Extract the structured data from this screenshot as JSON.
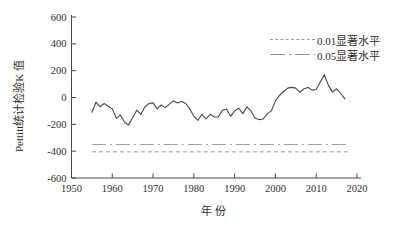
{
  "colors": {
    "background": "#ffffff",
    "axis": "#4a4a4a",
    "curve": "#474747",
    "ref_line": "#9b9b9b",
    "text": "#2f2f2f"
  },
  "legend": {
    "items": [
      {
        "label": "0.01显著水平",
        "style": "dashed"
      },
      {
        "label": "0.05显著水平",
        "style": "dashdot"
      }
    ]
  },
  "chart_data": {
    "type": "line",
    "title": "",
    "xlabel": "年份",
    "ylabel": "Pettitt统计检验K 值",
    "xlim": [
      1950,
      2020
    ],
    "ylim": [
      -600,
      600
    ],
    "grid": false,
    "legend_position": "top-right",
    "x_ticks": [
      1950,
      1960,
      1970,
      1980,
      1990,
      2000,
      2010,
      2020
    ],
    "y_ticks": [
      600,
      400,
      200,
      0,
      -200,
      -400,
      -600
    ],
    "x": [
      1955,
      1956,
      1957,
      1958,
      1959,
      1960,
      1961,
      1962,
      1963,
      1964,
      1965,
      1966,
      1967,
      1968,
      1969,
      1970,
      1971,
      1972,
      1973,
      1974,
      1975,
      1976,
      1977,
      1978,
      1979,
      1980,
      1981,
      1982,
      1983,
      1984,
      1985,
      1986,
      1987,
      1988,
      1989,
      1990,
      1991,
      1992,
      1993,
      1994,
      1995,
      1996,
      1997,
      1998,
      1999,
      2000,
      2001,
      2002,
      2003,
      2004,
      2005,
      2006,
      2007,
      2008,
      2009,
      2010,
      2011,
      2012,
      2013,
      2014,
      2015,
      2016,
      2017
    ],
    "series": [
      {
        "name": "Pettitt统计检验K 值",
        "style": "solid",
        "values": [
          -110,
          -35,
          -70,
          -45,
          -65,
          -85,
          -155,
          -130,
          -185,
          -205,
          -150,
          -95,
          -125,
          -70,
          -45,
          -40,
          -85,
          -55,
          -75,
          -50,
          -25,
          -40,
          -30,
          -45,
          -85,
          -140,
          -170,
          -125,
          -160,
          -125,
          -145,
          -145,
          -95,
          -85,
          -140,
          -100,
          -80,
          -120,
          -70,
          -100,
          -155,
          -165,
          -160,
          -120,
          -100,
          -25,
          15,
          45,
          70,
          75,
          70,
          40,
          65,
          75,
          55,
          60,
          115,
          170,
          90,
          40,
          65,
          30,
          -10
        ]
      }
    ],
    "ref_lines": [
      {
        "label": "0.01显著水平",
        "value": -405,
        "style": "dashed",
        "x_start": 1955,
        "x_end": 2018
      },
      {
        "label": "0.05显著水平",
        "value": -350,
        "style": "dashdot",
        "x_start": 1955,
        "x_end": 2018
      }
    ]
  }
}
